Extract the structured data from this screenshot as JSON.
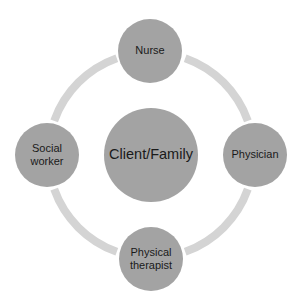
{
  "diagram": {
    "colors": {
      "node_fill": "#a3a3a3",
      "center_fill": "#a3a3a3",
      "ring": "#d4d4d4",
      "text": "#1a1a1a",
      "background": "#ffffff"
    },
    "center": {
      "label": "Client/Family"
    },
    "nodes": [
      {
        "label": "Nurse",
        "position": "top"
      },
      {
        "label": "Physician",
        "position": "right"
      },
      {
        "label": "Physical\ntherapist",
        "position": "bottom"
      },
      {
        "label": "Social\nworker",
        "position": "left"
      }
    ]
  }
}
